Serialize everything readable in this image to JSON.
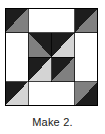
{
  "figure": {
    "kind": "quilt-block-diagram",
    "caption": "Make 2.",
    "block": {
      "name": "pinwheel-star-quilt-block",
      "grid_rows": 4,
      "grid_cols": 4,
      "outline_color": "#000000",
      "outline_width": 1,
      "width_px": 93,
      "height_px": 98
    },
    "colors": {
      "dark": "#1d1d1d",
      "medium_gray": "#808080",
      "light_gray": "#d4d4d4",
      "white": "#ffffff",
      "outline": "#000000",
      "caption_text": "#1a1a1a"
    },
    "legend": [
      {
        "swatch": "dark",
        "label": "dark"
      },
      {
        "swatch": "medium_gray",
        "label": "medium"
      },
      {
        "swatch": "light_gray",
        "label": "light"
      },
      {
        "swatch": "white",
        "label": "background"
      }
    ],
    "patches": [
      {
        "id": "corner-top-left-dark",
        "fill": "dark",
        "points": "0,0 46.5,0 0,49"
      },
      {
        "id": "corner-top-left-gray",
        "fill": "medium_gray",
        "points": "46.5,0 46.5,49 0,49"
      },
      {
        "id": "corner-top-right-dark",
        "fill": "dark",
        "points": "46.5,0 93,0 93,49"
      },
      {
        "id": "corner-top-right-gray",
        "fill": "medium_gray",
        "points": "46.5,0 93,49 46.5,49"
      },
      {
        "id": "corner-bottom-left-dark",
        "fill": "dark",
        "points": "0,49 46.5,49 0,98"
      },
      {
        "id": "corner-bottom-left-light",
        "fill": "light_gray",
        "points": "46.5,49 46.5,98 0,98"
      },
      {
        "id": "corner-bottom-right-gray",
        "fill": "medium_gray",
        "points": "46.5,49 93,49 46.5,98"
      },
      {
        "id": "corner-bottom-right-dark",
        "fill": "dark",
        "points": "93,49 93,98 46.5,98"
      },
      {
        "id": "edge-top-white",
        "fill": "white",
        "points": "23.25,0 69.75,0 69.75,24.5 23.25,24.5"
      },
      {
        "id": "edge-left-white",
        "fill": "white",
        "points": "0,24.5 23.25,24.5 23.25,73.5 0,73.5"
      },
      {
        "id": "edge-right-white",
        "fill": "white",
        "points": "69.75,24.5 93,24.5 93,73.5 69.75,73.5"
      },
      {
        "id": "edge-bottom-white",
        "fill": "white",
        "points": "23.25,73.5 69.75,73.5 69.75,98 23.25,98"
      },
      {
        "id": "star-point-top",
        "fill": "dark",
        "points": "23.25,24.5 69.75,24.5 46.5,49"
      },
      {
        "id": "star-point-left",
        "fill": "dark",
        "points": "23.25,24.5 46.5,49 23.25,73.5"
      },
      {
        "id": "star-point-right",
        "fill": "dark",
        "points": "69.75,24.5 69.75,73.5 46.5,49"
      },
      {
        "id": "star-point-bottom",
        "fill": "dark",
        "points": "23.25,73.5 46.5,49 69.75,73.5"
      },
      {
        "id": "center-tl-dark",
        "fill": "dark",
        "points": "23.25,24.5 46.5,24.5 23.25,49"
      },
      {
        "id": "center-tl-gray",
        "fill": "medium_gray",
        "points": "23.25,24.5 46.5,49 23.25,49"
      },
      {
        "id": "center-tr-light",
        "fill": "light_gray",
        "points": "46.5,24.5 69.75,24.5 69.75,49"
      },
      {
        "id": "center-bl-light",
        "fill": "light_gray",
        "points": "23.25,49 46.5,73.5 23.25,73.5"
      },
      {
        "id": "center-br-gray",
        "fill": "medium_gray",
        "points": "69.75,49 69.75,73.5 46.5,73.5"
      }
    ],
    "grid_lines": [
      {
        "id": "v-quarter",
        "x1": 23.25,
        "y1": 0,
        "x2": 23.25,
        "y2": 98
      },
      {
        "id": "v-half",
        "x1": 46.5,
        "y1": 0,
        "x2": 46.5,
        "y2": 98
      },
      {
        "id": "v-three-quarter",
        "x1": 69.75,
        "y1": 0,
        "x2": 69.75,
        "y2": 98
      },
      {
        "id": "h-quarter",
        "x1": 0,
        "y1": 24.5,
        "x2": 93,
        "y2": 24.5
      },
      {
        "id": "h-half",
        "x1": 0,
        "y1": 49,
        "x2": 93,
        "y2": 49
      },
      {
        "id": "h-three-quarter",
        "x1": 0,
        "y1": 73.5,
        "x2": 93,
        "y2": 73.5
      }
    ]
  }
}
